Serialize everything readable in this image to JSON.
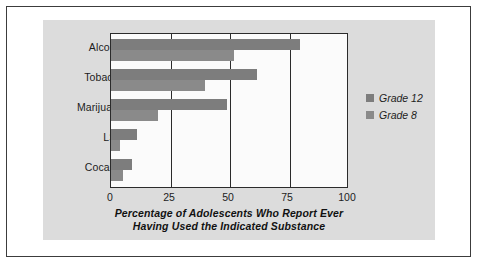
{
  "chart_data": {
    "type": "bar",
    "orientation": "horizontal",
    "title": "",
    "xlabel": "Percentage of Adolescents Who Report Ever Having Used the Indicated Substance",
    "xlabel_lines": [
      "Percentage of Adolescents Who Report Ever",
      "Having Used the Indicated Substance"
    ],
    "ylabel": "",
    "categories": [
      "Alcohol",
      "Tobacco",
      "Marijuana",
      "LSD",
      "Cocaine"
    ],
    "series": [
      {
        "name": "Grade 12",
        "color": "#7d7d7d",
        "values": [
          80,
          62,
          49,
          11,
          9
        ]
      },
      {
        "name": "Grade 8",
        "color": "#8a8a8a",
        "values": [
          52,
          40,
          20,
          4,
          5
        ]
      }
    ],
    "xlim": [
      0,
      100
    ],
    "xticks": [
      "0",
      "25",
      "50",
      "75",
      "100"
    ],
    "xtick_values": [
      0,
      25,
      50,
      75,
      100
    ],
    "grid": "vertical",
    "legend_position": "right"
  },
  "legend": {
    "items": [
      {
        "label": "Grade 12"
      },
      {
        "label": "Grade 8"
      }
    ]
  },
  "colors": {
    "grade12": "#7d7d7d",
    "grade8": "#8a8a8a",
    "panel": "#dcdcdc",
    "plot_background": "#fbfbfb",
    "axis": "#2b2b2b",
    "border": "#3c3c3c"
  }
}
